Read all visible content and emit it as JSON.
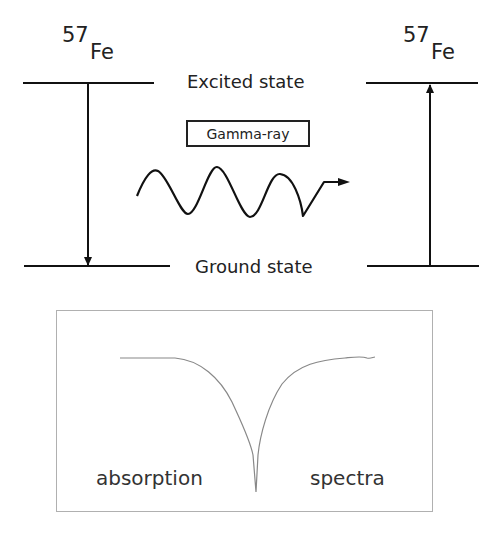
{
  "diagram": {
    "left_isotope": {
      "mass_number": "57",
      "element": "Fe"
    },
    "right_isotope": {
      "mass_number": "57",
      "element": "Fe"
    },
    "excited_state_label": "Excited state",
    "ground_state_label": "Ground state",
    "photon_label": "Gamma-ray",
    "left_transition": "emission (excited → ground, arrow down)",
    "right_transition": "absorption (ground → excited, arrow up)",
    "colors": {
      "lines": "#111111",
      "spectrum_curve": "#888888",
      "spectrum_border": "#b0b0b0"
    }
  },
  "spectrum_panel": {
    "left_label": "absorption",
    "right_label": "spectra"
  }
}
